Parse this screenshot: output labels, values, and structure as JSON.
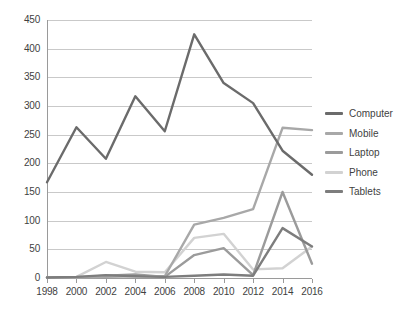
{
  "chart_data": {
    "type": "line",
    "title": "",
    "subtitle": "",
    "xlabel": "",
    "ylabel": "",
    "x": [
      1998,
      2000,
      2002,
      2004,
      2006,
      2008,
      2010,
      2012,
      2014,
      2016
    ],
    "xtick_labels": [
      "1998",
      "2000",
      "2002",
      "2004",
      "2006",
      "2008",
      "2010",
      "2012",
      "2014",
      "2016"
    ],
    "ytick_labels": [
      "0",
      "50",
      "100",
      "150",
      "200",
      "250",
      "300",
      "350",
      "400",
      "450"
    ],
    "ytick_values": [
      0,
      50,
      100,
      150,
      200,
      250,
      300,
      350,
      400,
      450
    ],
    "ylim": [
      0,
      450
    ],
    "xlim": [
      1998,
      2016
    ],
    "grid": "horizontal",
    "legend_position": "right",
    "series": [
      {
        "name": "Computer",
        "color": "#6b6b6b",
        "values": [
          167,
          263,
          208,
          317,
          256,
          425,
          340,
          305,
          222,
          180
        ]
      },
      {
        "name": "Mobile",
        "color": "#a8a8a8",
        "values": [
          1,
          1,
          2,
          3,
          3,
          93,
          105,
          120,
          262,
          258
        ]
      },
      {
        "name": "Laptop",
        "color": "#9b9b9b",
        "values": [
          1,
          1,
          4,
          6,
          2,
          40,
          52,
          5,
          150,
          25
        ]
      },
      {
        "name": "Phone",
        "color": "#d2d2d2",
        "values": [
          1,
          2,
          28,
          11,
          10,
          70,
          77,
          15,
          17,
          55
        ]
      },
      {
        "name": "Tablets",
        "color": "#7d7d7d",
        "values": [
          1,
          2,
          5,
          3,
          2,
          4,
          6,
          4,
          87,
          55
        ]
      }
    ]
  },
  "legend": {
    "items": [
      {
        "label": "Computer"
      },
      {
        "label": "Mobile"
      },
      {
        "label": "Laptop"
      },
      {
        "label": "Phone"
      },
      {
        "label": "Tablets"
      }
    ]
  },
  "colors": {
    "gridline": "#c9c9c9",
    "axis": "#9a9a9a",
    "text": "#3f3f3f",
    "background": "#ffffff"
  }
}
